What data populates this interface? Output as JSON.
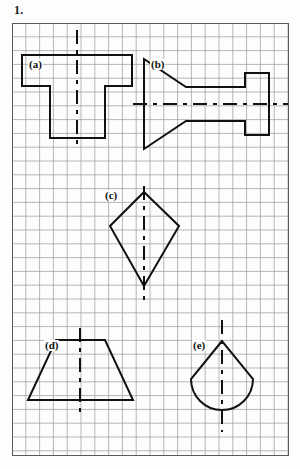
{
  "page": {
    "question_number": "1.",
    "background_color": "#fdfdfd"
  },
  "grid": {
    "cell_size_px": 13.8,
    "columns": 20,
    "rows": 31,
    "line_color": "#9a9a9a",
    "border_color": "#5a5a5a",
    "origin": {
      "x": 12,
      "y": 23
    },
    "width": 277,
    "height": 433
  },
  "style": {
    "shape_stroke_color": "#111111",
    "shape_stroke_width": 2.0,
    "axis_stroke_color": "#111111",
    "axis_stroke_width": 2.0,
    "axis_dash": "14 6 4 6"
  },
  "figures": [
    {
      "id": "a",
      "label": "(a)",
      "shape_name": "tee-shape",
      "symmetry": "vertical",
      "axis": {
        "x1": 77,
        "y1": 30,
        "x2": 77,
        "y2": 148,
        "orientation": "vertical"
      },
      "outline_points": "22,55 132,55 132,86 105,86 105,138 50,138 50,86 22,86"
    },
    {
      "id": "b",
      "label": "(b)",
      "shape_name": "wedge-and-shaft-shape",
      "symmetry": "horizontal",
      "axis": {
        "x1": 133,
        "y1": 104,
        "x2": 288,
        "y2": 104,
        "orientation": "horizontal"
      },
      "outline_points": "144,59 186,87 245,87 245,73 269,73 269,135 245,135 245,121 186,121 144,149"
    },
    {
      "id": "c",
      "label": "(c)",
      "shape_name": "kite-arrowhead-shape",
      "symmetry": "vertical",
      "axis": {
        "x1": 144,
        "y1": 186,
        "x2": 144,
        "y2": 300,
        "orientation": "vertical"
      },
      "outline_points": "144,192 179,226 144,286 110,226"
    },
    {
      "id": "d",
      "label": "(d)",
      "shape_name": "trapezoid-shape",
      "symmetry": "vertical",
      "axis": {
        "x1": 80,
        "y1": 328,
        "x2": 80,
        "y2": 415,
        "orientation": "vertical"
      },
      "outline_points": "56,340 105,340 133,400 28,400"
    },
    {
      "id": "e",
      "label": "(e)",
      "shape_name": "pointed-dome-shape",
      "symmetry": "vertical",
      "axis": {
        "x1": 222,
        "y1": 320,
        "x2": 222,
        "y2": 432,
        "orientation": "vertical"
      },
      "apex": {
        "x": 222,
        "y": 341
      },
      "left_shoulder": {
        "x": 191,
        "y": 379
      },
      "right_shoulder": {
        "x": 253,
        "y": 379
      },
      "arc_radius": 31
    }
  ]
}
